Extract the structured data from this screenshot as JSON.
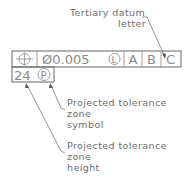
{
  "colors": {
    "line": "#7a7a7a",
    "text": "#6e6e6e",
    "frame_text": "#8a8a8a",
    "background": "#ffffff"
  },
  "callout_top": {
    "line1": "Tertiary datum",
    "line2": "letter"
  },
  "frame": {
    "row1": {
      "symbol": "position-icon",
      "tolerance": "Ø0.005",
      "modifier": "L",
      "datums": [
        "A",
        "B",
        "C"
      ]
    },
    "row2": {
      "height": "24",
      "modifier": "P"
    }
  },
  "callout_symbol": {
    "line1": "Projected tolerance",
    "line2": "zone",
    "line3": "symbol"
  },
  "callout_height": {
    "line1": "Projected tolerance",
    "line2": "zone",
    "line3": "height"
  }
}
